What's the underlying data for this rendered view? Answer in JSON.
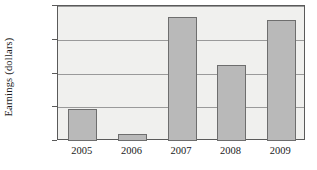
{
  "chart_data": {
    "type": "bar",
    "title": "",
    "xlabel": "",
    "ylabel": "Earnings (dollars)",
    "categories": [
      "2005",
      "2006",
      "2007",
      "2008",
      "2009"
    ],
    "values": [
      34980,
      34600,
      36330,
      35620,
      36290
    ],
    "ylim": [
      34500,
      36500
    ],
    "yticks": [
      34500,
      35000,
      35500,
      36000,
      36500
    ],
    "ytick_labels": [
      "34,500",
      "35,000",
      "35,500",
      "36,000",
      "36,500"
    ],
    "grid": true,
    "legend": "none",
    "colors": {
      "bar_fill": "#b9b9b9",
      "bar_edge": "#6e6e6e",
      "plot_background": "#f0f0ee",
      "gridline": "#9a9a9a",
      "axis": "#5a5a5a",
      "text": "#1a1a1a",
      "figure_background": "#ffffff"
    }
  }
}
